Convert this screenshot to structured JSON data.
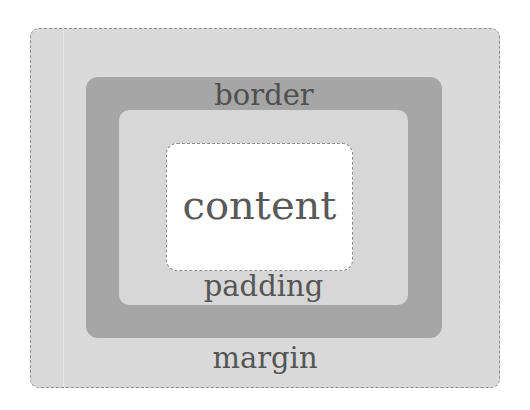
{
  "diagram": {
    "layers": [
      {
        "id": "margin",
        "label": "margin",
        "fill": "#dadada",
        "outline": "dashed"
      },
      {
        "id": "border",
        "label": "border",
        "fill": "#a6a6a6",
        "outline": "none"
      },
      {
        "id": "padding",
        "label": "padding",
        "fill": "#d7d7d7",
        "outline": "none"
      },
      {
        "id": "content",
        "label": "content",
        "fill": "#ffffff",
        "outline": "dashed"
      }
    ],
    "labels": {
      "margin": "margin",
      "border": "border",
      "padding": "padding",
      "content": "content"
    }
  }
}
